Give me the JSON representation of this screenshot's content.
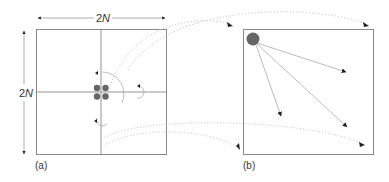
{
  "figure": {
    "panel_a": {
      "caption": "(a)",
      "width_label": "2N",
      "height_label": "2N"
    },
    "panel_b": {
      "caption": "(b)"
    }
  },
  "colors": {
    "stroke": "#888888",
    "dots": "#666666",
    "dotted": "#c8c8c8",
    "text": "#333333"
  }
}
